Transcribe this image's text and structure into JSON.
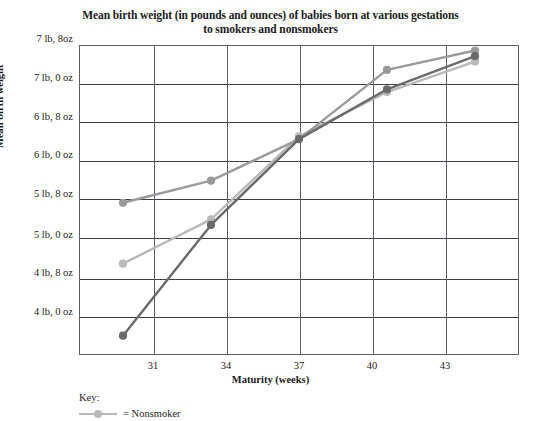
{
  "chart_data": {
    "type": "line",
    "title": "Mean birth weight (in pounds and ounces) of babies born at various gestations to smokers and nonsmokers",
    "title_line1": "Mean birth weight (in pounds and ounces) of babies born at various gestations",
    "title_line2": "to smokers and nonsmokers",
    "xlabel": "Maturity (weeks)",
    "ylabel": "Mean birth weight",
    "x": [
      31,
      34,
      37,
      40,
      43
    ],
    "xtick_labels": [
      "31",
      "34",
      "37",
      "40",
      "43"
    ],
    "ytick_labels": [
      "7 lb, 8oz",
      "7 lb, 0 oz",
      "6 lb, 8 oz",
      "6 lb, 0 oz",
      "5 lb, 8 oz",
      "5 lb, 0 oz",
      "4 lb, 8 oz",
      "4 lb, 0 oz"
    ],
    "ytick_values_oz": [
      120,
      112,
      104,
      96,
      88,
      80,
      72,
      64
    ],
    "ylim_oz": [
      64,
      120
    ],
    "ylim_labels": [
      "4 lb, 0 oz",
      "7 lb, 8oz"
    ],
    "xlim": [
      29.5,
      44.5
    ],
    "grid": "horizontal-and-vertical",
    "legend_position": "below-plot-left",
    "series": [
      {
        "name": "Nonsmoker",
        "color": "#b9b9b9",
        "marker": "circle",
        "values_oz": [
          80.5,
          88.5,
          103.5,
          111.5,
          117.0
        ],
        "value_labels": [
          "5 lb, 0.5 oz",
          "5 lb, 8.5 oz",
          "6 lb, 7.5 oz",
          "6 lb, 15.5 oz",
          "7 lb, 5 oz"
        ]
      },
      {
        "name": "Series 2",
        "color": "#9a9a9a",
        "marker": "circle",
        "values_oz": [
          91.5,
          95.5,
          103.0,
          115.5,
          119.0
        ],
        "value_labels": [
          "5 lb, 11.5 oz",
          "5 lb, 15.5 oz",
          "6 lb, 7 oz",
          "7 lb, 3.5 oz",
          "7 lb, 7 oz"
        ]
      },
      {
        "name": "Smoker",
        "color": "#6a6a6a",
        "marker": "circle",
        "values_oz": [
          67.5,
          87.5,
          103.0,
          112.0,
          118.0
        ],
        "value_labels": [
          "4 lb, 3.5 oz",
          "5 lb, 7.5 oz",
          "6 lb, 7 oz",
          "7 lb, 0 oz",
          "7 lb, 6 oz"
        ]
      }
    ]
  },
  "legend": {
    "heading": "Key:",
    "entries": [
      {
        "label": "= Nonsmoker",
        "color": "#b9b9b9"
      }
    ]
  },
  "colors": {
    "axis": "#5c5c66",
    "grid": "#3d3d47",
    "text": "#1a1a1a",
    "background": "#ffffff"
  }
}
